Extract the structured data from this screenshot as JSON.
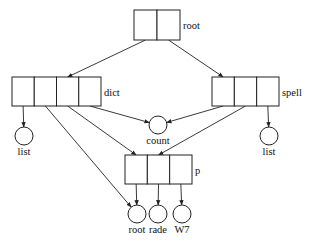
{
  "diagram": {
    "type": "pointer-structure",
    "boxes": [
      {
        "id": "root",
        "label": "root",
        "cells": 2,
        "x": 134,
        "y": 10,
        "w": 46,
        "h": 30
      },
      {
        "id": "dict",
        "label": "dict",
        "cells": 4,
        "x": 12,
        "y": 77,
        "w": 89,
        "h": 29
      },
      {
        "id": "spell",
        "label": "spell",
        "cells": 3,
        "x": 212,
        "y": 77,
        "w": 67,
        "h": 29
      },
      {
        "id": "p",
        "label": "p",
        "cells": 3,
        "x": 125,
        "y": 155,
        "w": 67,
        "h": 29
      }
    ],
    "nodes": [
      {
        "id": "count",
        "label": "count",
        "cx": 158,
        "cy": 125,
        "r": 9
      },
      {
        "id": "list_left",
        "label": "list",
        "cx": 24,
        "cy": 136,
        "r": 9
      },
      {
        "id": "list_right",
        "label": "list",
        "cx": 269,
        "cy": 136,
        "r": 9
      },
      {
        "id": "root_leaf",
        "label": "root",
        "cx": 137,
        "cy": 214,
        "r": 9
      },
      {
        "id": "rade",
        "label": "rade",
        "cx": 158,
        "cy": 214,
        "r": 9
      },
      {
        "id": "w7",
        "label": "W7",
        "cx": 182,
        "cy": 214,
        "r": 9
      }
    ],
    "edges": [
      {
        "from": "root.cell0",
        "to": "dict.cell2"
      },
      {
        "from": "root.cell1",
        "to": "spell.cell0"
      },
      {
        "from": "dict.cell0",
        "to": "list_left"
      },
      {
        "from": "dict.cell1",
        "to": "root_leaf"
      },
      {
        "from": "dict.cell2",
        "to": "p.cell0"
      },
      {
        "from": "dict.cell3",
        "to": "count"
      },
      {
        "from": "spell.cell0",
        "to": "count"
      },
      {
        "from": "spell.cell1",
        "to": "p.cell1"
      },
      {
        "from": "spell.cell2",
        "to": "list_right"
      },
      {
        "from": "p.cell0",
        "to": "root_leaf"
      },
      {
        "from": "p.cell1",
        "to": "rade"
      },
      {
        "from": "p.cell2",
        "to": "w7"
      }
    ]
  }
}
